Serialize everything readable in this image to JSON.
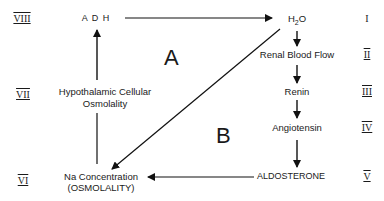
{
  "nodes": {
    "adh": "A D H",
    "h2o_h": "H",
    "h2o_sub": "2",
    "h2o_o": "O",
    "renal_blood_flow": "Renal  Blood  Flow",
    "renin": "Renin",
    "angiotensin": "Angiotensin",
    "aldosterone": "ALDOSTERONE",
    "na_concentration": "Na  Concentration",
    "osmolality": "(OSMOLALITY)",
    "hypothalamic_line1": "Hypothalamic  Cellular",
    "hypothalamic_line2": "Osmolality"
  },
  "regions": {
    "a": "A",
    "b": "B"
  },
  "roman_numerals": {
    "i": "I",
    "ii": "II",
    "iii": "III",
    "iv": "IV",
    "v": "V",
    "vi": "VI",
    "vii": "VII",
    "viii": "VIII"
  }
}
